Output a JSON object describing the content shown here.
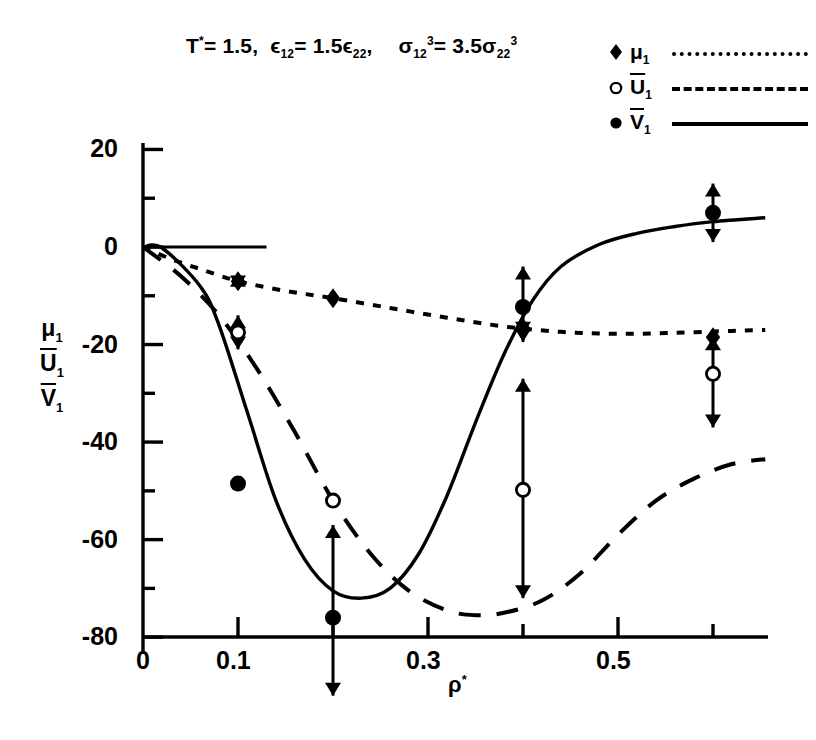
{
  "title": {
    "t_symbol": "T",
    "t_star": "*",
    "t_eq": "= 1.5,",
    "eps_sym": "ϵ",
    "eps_sub1": "12",
    "eps_eq": "= 1.5",
    "eps_sym2": "ϵ",
    "eps_sub2": "22",
    "eps_comma": ",",
    "sig_sym": "σ",
    "sig_sub1": "12",
    "sig_sup1": "3",
    "sig_eq": "= 3.5",
    "sig_sym2": "σ",
    "sig_sub2": "22",
    "sig_sup2": "3",
    "full_text": "T* = 1.5,  ϵ12 = 1.5ϵ22,  σ12³ = 3.5σ22³"
  },
  "legend": {
    "entries": [
      {
        "marker": "diamond-filled",
        "symbol": "μ",
        "sub": "1",
        "overline": false,
        "linestyle": "dotted",
        "label": "μ1"
      },
      {
        "marker": "circle-open",
        "symbol": "U",
        "sub": "1",
        "overline": true,
        "linestyle": "dashed",
        "label": "U̅1"
      },
      {
        "marker": "circle-filled",
        "symbol": "V",
        "sub": "1",
        "overline": true,
        "linestyle": "solid",
        "label": "V̅1"
      }
    ]
  },
  "axes": {
    "ylabel_parts": [
      {
        "symbol": "μ",
        "sub": "1",
        "overline": false
      },
      {
        "symbol": "U",
        "sub": "1",
        "overline": true
      },
      {
        "symbol": "V",
        "sub": "1",
        "overline": true
      }
    ],
    "xlabel_symbol": "ρ",
    "xlabel_sup": "*",
    "xlabel": "ρ*",
    "ylabel": "μ1, U̅1, V̅1",
    "ytick_labels": [
      "20",
      "0",
      "-20",
      "-40",
      "-60",
      "-80"
    ],
    "ytick_values": [
      20,
      0,
      -20,
      -40,
      -60,
      -80
    ],
    "yminor_values": [
      10,
      -10,
      -30,
      -50,
      -70
    ],
    "xtick_labels": [
      "0",
      "0.1",
      "0.3",
      "0.5"
    ],
    "xtick_values": [
      0,
      0.1,
      0.3,
      0.5
    ],
    "xminor_values": [
      0.2,
      0.4,
      0.6
    ],
    "xlim": [
      0,
      0.655
    ],
    "ylim": [
      -80,
      26
    ],
    "grid": "off"
  },
  "chart_data": {
    "type": "line",
    "xlabel": "ρ*",
    "ylabel": "μ1, U̅1, V̅1",
    "xlim": [
      0,
      0.655
    ],
    "ylim": [
      -80,
      26
    ],
    "grid": "off",
    "legend_position": "top-right",
    "series": [
      {
        "name": "μ1",
        "marker": "diamond-filled",
        "linestyle": "dotted",
        "curve": [
          [
            0.0,
            0.0
          ],
          [
            0.03,
            -2.5
          ],
          [
            0.06,
            -4.5
          ],
          [
            0.1,
            -7.0
          ],
          [
            0.15,
            -9.0
          ],
          [
            0.2,
            -10.5
          ],
          [
            0.26,
            -12.5
          ],
          [
            0.32,
            -14.5
          ],
          [
            0.38,
            -16.3
          ],
          [
            0.44,
            -17.4
          ],
          [
            0.5,
            -17.8
          ],
          [
            0.56,
            -17.6
          ],
          [
            0.62,
            -17.2
          ],
          [
            0.655,
            -17.0
          ]
        ],
        "points": [
          {
            "x": 0.1,
            "y": -7.0,
            "err_low": -8.5,
            "err_high": -5.5
          },
          {
            "x": 0.2,
            "y": -10.5,
            "err_low": -10.5,
            "err_high": -10.5
          },
          {
            "x": 0.4,
            "y": -16.6,
            "err_low": -19.5,
            "err_high": -16.6
          },
          {
            "x": 0.6,
            "y": -18.5,
            "err_low": -18.5,
            "err_high": -18.5
          }
        ]
      },
      {
        "name": "U̅1",
        "marker": "circle-open",
        "linestyle": "dashed",
        "curve": [
          [
            0.0,
            0.0
          ],
          [
            0.04,
            -6.0
          ],
          [
            0.08,
            -14.0
          ],
          [
            0.12,
            -25.0
          ],
          [
            0.16,
            -38.0
          ],
          [
            0.2,
            -52.0
          ],
          [
            0.24,
            -63.0
          ],
          [
            0.28,
            -70.5
          ],
          [
            0.32,
            -74.5
          ],
          [
            0.35,
            -75.5
          ],
          [
            0.38,
            -75.0
          ],
          [
            0.42,
            -72.5
          ],
          [
            0.46,
            -67.0
          ],
          [
            0.5,
            -59.0
          ],
          [
            0.54,
            -52.0
          ],
          [
            0.58,
            -47.5
          ],
          [
            0.62,
            -44.5
          ],
          [
            0.655,
            -43.5
          ]
        ],
        "points": [
          {
            "x": 0.1,
            "y": -17.5,
            "err_low": -21.0,
            "err_high": -14.0
          },
          {
            "x": 0.2,
            "y": -52.0,
            "err_low": -52.0,
            "err_high": -52.0
          },
          {
            "x": 0.4,
            "y": -49.8,
            "err_low": -72.0,
            "err_high": -27.0
          },
          {
            "x": 0.6,
            "y": -26.0,
            "err_low": -37.0,
            "err_high": -18.5
          }
        ]
      },
      {
        "name": "V̅1",
        "marker": "circle-filled",
        "linestyle": "solid",
        "curve": [
          [
            0.0,
            0.0
          ],
          [
            0.02,
            -0.2
          ],
          [
            0.06,
            -8.0
          ],
          [
            0.08,
            -16.0
          ],
          [
            0.11,
            -34.0
          ],
          [
            0.14,
            -52.0
          ],
          [
            0.17,
            -64.0
          ],
          [
            0.2,
            -70.5
          ],
          [
            0.23,
            -72.0
          ],
          [
            0.26,
            -70.0
          ],
          [
            0.29,
            -63.0
          ],
          [
            0.32,
            -51.0
          ],
          [
            0.35,
            -36.0
          ],
          [
            0.38,
            -22.0
          ],
          [
            0.41,
            -11.0
          ],
          [
            0.44,
            -4.0
          ],
          [
            0.48,
            0.5
          ],
          [
            0.52,
            2.8
          ],
          [
            0.56,
            4.2
          ],
          [
            0.6,
            5.2
          ],
          [
            0.655,
            6.0
          ]
        ],
        "points": [
          {
            "x": 0.1,
            "y": -48.5,
            "err_low": -48.5,
            "err_high": -48.5
          },
          {
            "x": 0.2,
            "y": -76.0,
            "err_low": -92.0,
            "err_high": -57.0
          },
          {
            "x": 0.4,
            "y": -12.3,
            "err_low": -18.0,
            "err_high": -4.0
          },
          {
            "x": 0.6,
            "y": 7.0,
            "err_low": 1.0,
            "err_high": 13.0
          }
        ]
      }
    ],
    "zero_reference_line": {
      "y": 0,
      "x_from": 0.0,
      "x_to": 0.13
    }
  }
}
